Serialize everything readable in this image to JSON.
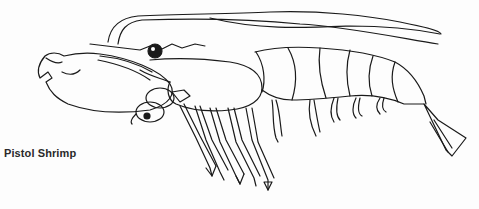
{
  "figure": {
    "caption": "Pistol Shrimp",
    "colors": {
      "ink": "#1a1a1a",
      "background": "#fdfdfd"
    }
  }
}
